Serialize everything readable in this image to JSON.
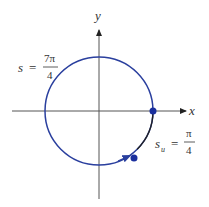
{
  "axes": {
    "x_label": "x",
    "y_label": "y"
  },
  "labels": {
    "left": {
      "var": "s",
      "eq": "=",
      "num": "7π",
      "den": "4"
    },
    "right": {
      "var": "s",
      "sub": "u",
      "eq": "=",
      "num": "π",
      "den": "4"
    }
  },
  "colors": {
    "circle": "#2a3f9e",
    "axis": "#555555",
    "arc": "#222222"
  }
}
